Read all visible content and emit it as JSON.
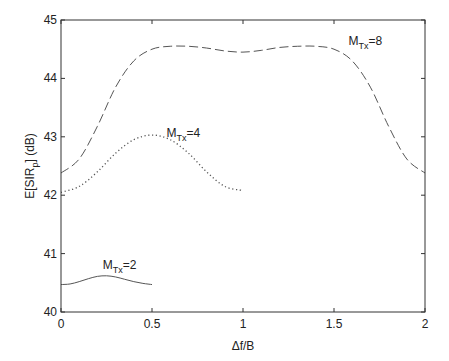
{
  "chart_data": {
    "type": "line",
    "title": "",
    "xlabel": "Δf/B",
    "ylabel": "E[SIR_p] (dB)",
    "xlim": [
      0,
      2
    ],
    "ylim": [
      40,
      45
    ],
    "grid": false,
    "legend": "none (inline annotations)",
    "x_ticks": [
      "0",
      "0.5",
      "1",
      "1.5",
      "2"
    ],
    "y_ticks": [
      "40",
      "41",
      "42",
      "43",
      "44",
      "45"
    ],
    "series": [
      {
        "name": "M_Tx=8",
        "style": "dashed",
        "x": [
          0,
          0.1,
          0.2,
          0.3,
          0.4,
          0.5,
          0.6,
          0.7,
          0.8,
          0.9,
          1.0,
          1.1,
          1.2,
          1.3,
          1.4,
          1.5,
          1.6,
          1.7,
          1.8,
          1.9,
          2.0
        ],
        "values": [
          42.38,
          42.62,
          43.18,
          43.85,
          44.3,
          44.5,
          44.55,
          44.55,
          44.52,
          44.47,
          44.45,
          44.48,
          44.53,
          44.55,
          44.55,
          44.5,
          44.3,
          43.85,
          43.18,
          42.62,
          42.38
        ]
      },
      {
        "name": "M_Tx=4",
        "style": "dotted",
        "x": [
          0,
          0.1,
          0.2,
          0.3,
          0.4,
          0.5,
          0.6,
          0.7,
          0.8,
          0.9,
          1.0
        ],
        "values": [
          42.05,
          42.15,
          42.4,
          42.72,
          42.95,
          43.03,
          42.95,
          42.72,
          42.4,
          42.15,
          42.08
        ]
      },
      {
        "name": "M_Tx=2",
        "style": "solid",
        "x": [
          0,
          0.05,
          0.1,
          0.15,
          0.2,
          0.25,
          0.3,
          0.35,
          0.4,
          0.45,
          0.5
        ],
        "values": [
          40.47,
          40.48,
          40.52,
          40.57,
          40.61,
          40.62,
          40.6,
          40.56,
          40.52,
          40.49,
          40.47
        ]
      }
    ],
    "annotations": [
      {
        "series": "M_Tx=8",
        "base": "M",
        "sub": "Tx",
        "suffix": "=8",
        "x": 1.58,
        "y": 44.57
      },
      {
        "series": "M_Tx=4",
        "base": "M",
        "sub": "Tx",
        "suffix": "=4",
        "x": 0.58,
        "y": 43.0
      },
      {
        "series": "M_Tx=2",
        "base": "M",
        "sub": "Tx",
        "suffix": "=2",
        "x": 0.23,
        "y": 40.73
      }
    ]
  },
  "labels": {
    "xlabel": "Δf/B",
    "ylabel_main": "E[SIR",
    "ylabel_sub": "p",
    "ylabel_tail": "] (dB)"
  },
  "colors": {
    "axis": "#333333",
    "line": "#555555",
    "text": "#222222"
  }
}
